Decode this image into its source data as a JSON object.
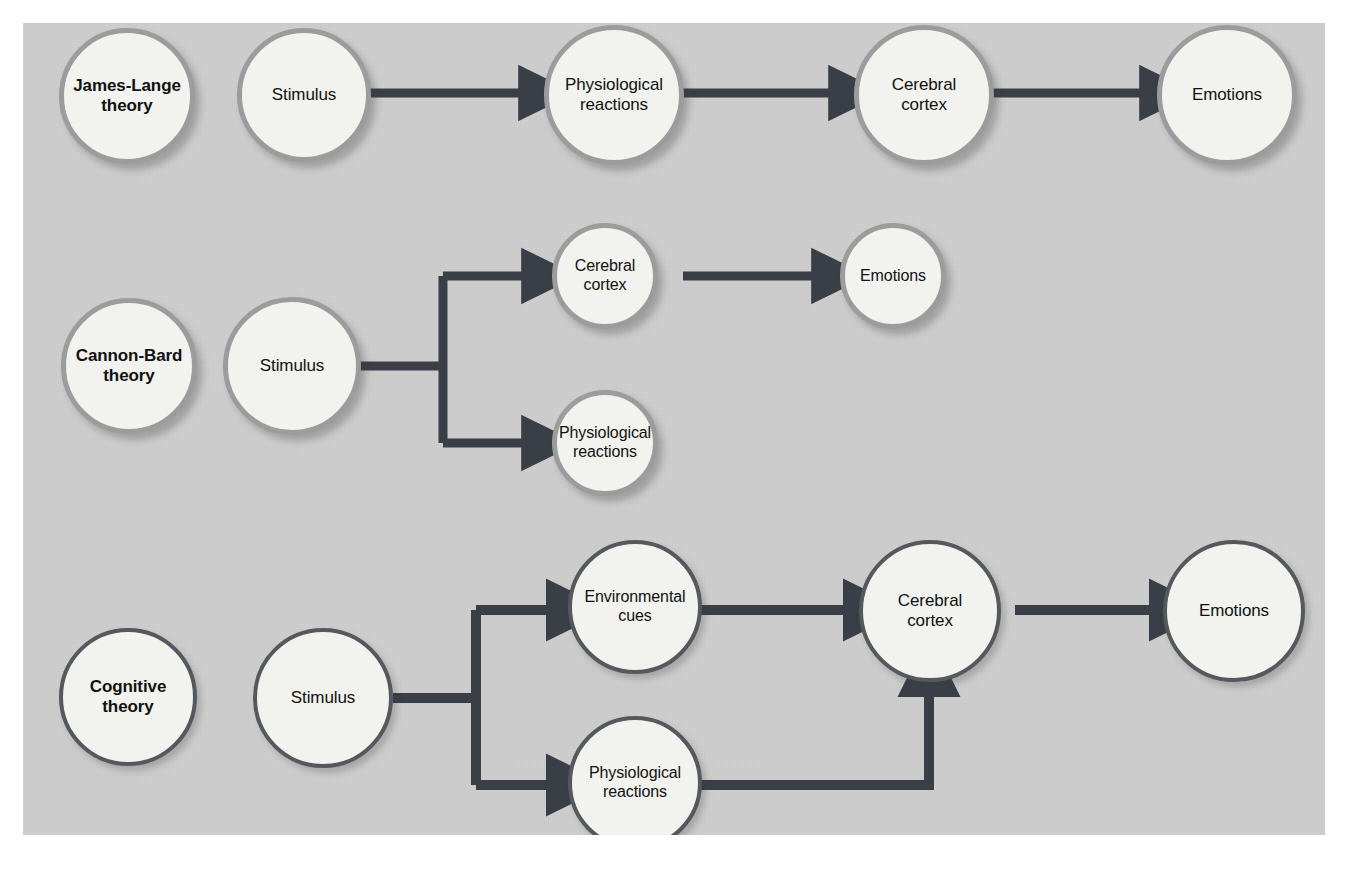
{
  "diagram": {
    "panel_background": "#c9c9c9",
    "node_fill": "#f2f2ef",
    "connector_color": "#3a3f47",
    "ring_light_color": "#9c9c9c",
    "ring_dark_color": "#55585c"
  },
  "rows": [
    {
      "id": "james-lange",
      "theory_label": "James-Lange\ntheory",
      "theory_label_line1": "James-Lange",
      "theory_label_line2": "theory",
      "nodes": [
        {
          "id": "jl-stimulus",
          "label": "Stimulus"
        },
        {
          "id": "jl-physiological",
          "label_line1": "Physiological",
          "label_line2": "reactions"
        },
        {
          "id": "jl-cortex",
          "label_line1": "Cerebral",
          "label_line2": "cortex"
        },
        {
          "id": "jl-emotions",
          "label": "Emotions"
        }
      ],
      "flow": "Stimulus → Physiological reactions → Cerebral cortex → Emotions"
    },
    {
      "id": "cannon-bard",
      "theory_label": "Cannon-Bard\ntheory",
      "theory_label_line1": "Cannon-Bard",
      "theory_label_line2": "theory",
      "nodes": [
        {
          "id": "cb-stimulus",
          "label": "Stimulus"
        },
        {
          "id": "cb-cortex",
          "label_line1": "Cerebral",
          "label_line2": "cortex"
        },
        {
          "id": "cb-physiological",
          "label_line1": "Physiological",
          "label_line2": "reactions"
        },
        {
          "id": "cb-emotions",
          "label": "Emotions"
        }
      ],
      "flow": "Stimulus → (Cerebral cortex → Emotions) and (Physiological reactions)"
    },
    {
      "id": "cognitive",
      "theory_label": "Cognitive\ntheory",
      "theory_label_line1": "Cognitive",
      "theory_label_line2": "theory",
      "nodes": [
        {
          "id": "cog-stimulus",
          "label": "Stimulus"
        },
        {
          "id": "cog-environmental",
          "label_line1": "Environmental",
          "label_line2": "cues"
        },
        {
          "id": "cog-physiological",
          "label_line1": "Physiological",
          "label_line2": "reactions"
        },
        {
          "id": "cog-cortex",
          "label_line1": "Cerebral",
          "label_line2": "cortex"
        },
        {
          "id": "cog-emotions",
          "label": "Emotions"
        }
      ],
      "flow": "Stimulus → (Environmental cues + Physiological reactions) → Cerebral cortex → Emotions"
    }
  ]
}
